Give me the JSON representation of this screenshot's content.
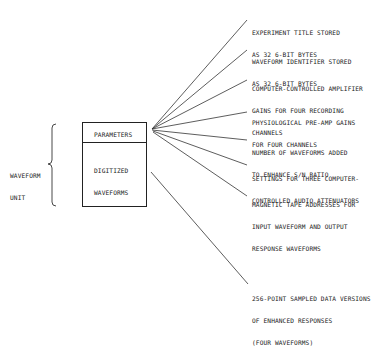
{
  "unit_label": [
    "WAVEFORM",
    "UNIT"
  ],
  "box": {
    "header": "PARAMETERS",
    "body": [
      "DIGITIZED",
      "WAVEFORMS"
    ]
  },
  "annotations": [
    {
      "lines": [
        "EXPERIMENT TITLE STORED",
        "AS 32 6-BIT BYTES"
      ]
    },
    {
      "lines": [
        "WAVEFORM IDENTIFIER STORED",
        "AS 32 6-BIT BYTES"
      ]
    },
    {
      "lines": [
        "COMPUTER-CONTROLLED AMPLIFIER",
        "GAINS FOR FOUR RECORDING",
        "CHANNELS"
      ]
    },
    {
      "lines": [
        "PHYSIOLOGICAL PRE-AMP GAINS",
        "FOR FOUR CHANNELS"
      ]
    },
    {
      "lines": [
        "NUMBER OF WAVEFORMS ADDED",
        "TO ENHANCE S/N RATIO"
      ]
    },
    {
      "lines": [
        "SETTINGS FOR THREE COMPUTER-",
        "CONTROLLED AUDIO ATTENUATORS"
      ]
    },
    {
      "lines": [
        "MAGNETIC TAPE ADDRESSES FOR",
        "INPUT WAVEFORM AND OUTPUT",
        "RESPONSE WAVEFORMS"
      ]
    },
    {
      "lines": [
        "256-POINT SAMPLED DATA VERSIONS",
        "OF ENHANCED RESPONSES",
        "(FOUR WAVEFORMS)"
      ]
    }
  ]
}
